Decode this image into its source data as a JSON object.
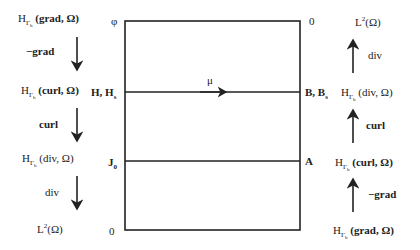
{
  "diagram": {
    "box": {
      "left": 125,
      "right": 300,
      "top": 21,
      "bottom": 230,
      "mid_line_y": 92,
      "j_line_y": 161
    },
    "corner_labels": {
      "top_left": "φ",
      "top_right": "0",
      "bottom_left": "0"
    },
    "line_labels": {
      "h_left": "H, H",
      "h_left_sub": "s",
      "b_right": "B, B",
      "b_right_sub": "s",
      "j_left": "J",
      "j_left_sub": "0",
      "a_right": "A",
      "mu": "μ"
    },
    "left_sequence": [
      {
        "space": "H",
        "sub": "Γ",
        "subsub": "h",
        "arg": "(grad, Ω)",
        "bold_arg": true
      },
      {
        "operator": "−grad",
        "bold": true
      },
      {
        "space": "H",
        "sub": "Γ",
        "subsub": "h",
        "arg": "(curl, Ω)",
        "bold_arg": true
      },
      {
        "operator": "curl",
        "bold": true
      },
      {
        "space": "H",
        "sub": "Γ",
        "subsub": "h",
        "arg": "(div, Ω)",
        "bold_arg": false
      },
      {
        "operator": "div",
        "bold": false
      },
      {
        "space": "L",
        "sup": "2",
        "arg": "(Ω)"
      }
    ],
    "right_sequence": [
      {
        "space": "L",
        "sup": "2",
        "arg": "(Ω)"
      },
      {
        "operator": "div",
        "bold": false
      },
      {
        "space": "H",
        "sub": "Γ",
        "subsub": "b",
        "arg": "(div, Ω)",
        "bold_arg": false
      },
      {
        "operator": "curl",
        "bold": true
      },
      {
        "space": "H",
        "sub": "Γ",
        "subsub": "b",
        "arg": "(curl, Ω)",
        "bold_arg": true
      },
      {
        "operator": "−grad",
        "bold": true
      },
      {
        "space": "H",
        "sub": "Γ",
        "subsub": "b",
        "arg": "(grad, Ω)",
        "bold_arg": true
      }
    ]
  }
}
